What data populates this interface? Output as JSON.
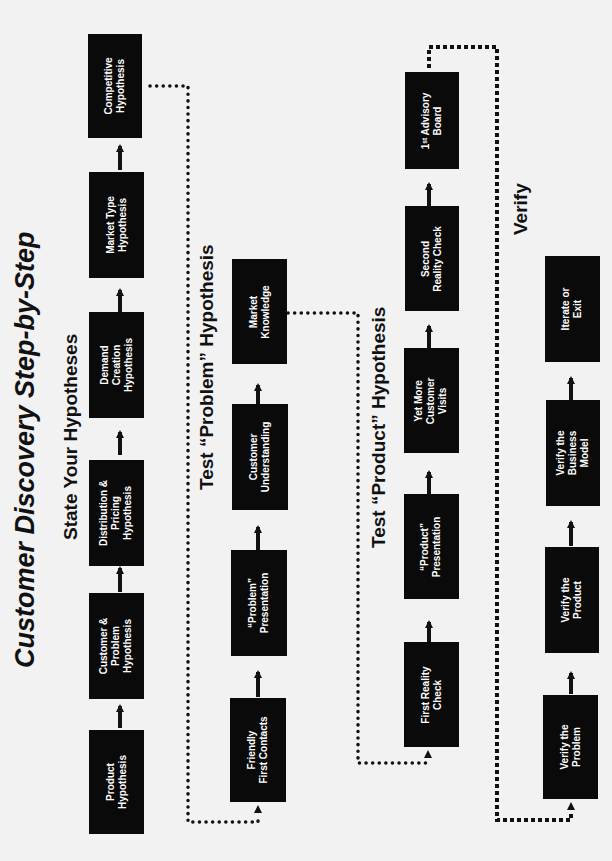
{
  "title": "Customer Discovery Step-by-Step",
  "sections": [
    {
      "title": "State Your Hypotheses",
      "steps": [
        "Product\nHypothesis",
        "Customer &\nProblem\nHypothesis",
        "Distribution &\nPricing\nHypothesis",
        "Demand\nCreation\nHypothesis",
        "Market Type\nHypothesis",
        "Competitive\nHypothesis"
      ]
    },
    {
      "title": "Test “Problem” Hypothesis",
      "steps": [
        "Friendly\nFirst Contacts",
        "“Problem”\nPresentation",
        "Customer\nUnderstanding",
        "Market\nKnowledge"
      ]
    },
    {
      "title": "Test “Product” Hypothesis",
      "steps": [
        "First Reality\nCheck",
        "“Product”\nPresentation",
        "Yet More\nCustomer\nVisits",
        "Second\nReality Check",
        "1ˢᵗ Advisory\nBoard"
      ]
    },
    {
      "title": "Verify",
      "steps": [
        "Verify the\nProblem",
        "Verify the\nProduct",
        "Verify the\nBusiness\nModel",
        "Iterate or\nExit"
      ]
    }
  ],
  "colors": {
    "box": "#0a0a0a",
    "box_text": "#ffffff",
    "background": "#f2f2f2",
    "line": "#111111"
  }
}
